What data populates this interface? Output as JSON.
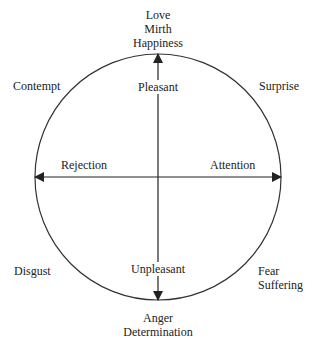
{
  "diagram": {
    "type": "circumplex",
    "colors": {
      "stroke": "#222222",
      "text": "#222222",
      "background": "#ffffff"
    },
    "axes": {
      "vertical": {
        "top_label": "Pleasant",
        "bottom_label": "Unpleasant"
      },
      "horizontal": {
        "left_label": "Rejection",
        "right_label": "Attention"
      }
    },
    "poles": {
      "top": [
        "Love",
        "Mirth",
        "Happiness"
      ],
      "bottom": [
        "Anger",
        "Determination"
      ]
    },
    "quadrants": {
      "upper_left": "Contempt",
      "upper_right": "Surprise",
      "lower_left": "Disgust",
      "lower_right": [
        "Fear",
        "Suffering"
      ]
    }
  }
}
